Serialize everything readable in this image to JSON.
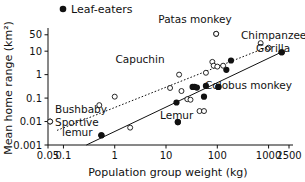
{
  "chart_data": {
    "type": "scatter",
    "title": "",
    "xlabel": "Population group weight (kg)",
    "ylabel": "Mean home range (km²)",
    "xscale": "log",
    "yscale": "log",
    "xlim": [
      0.05,
      2500
    ],
    "ylim": [
      0.001,
      80
    ],
    "grid": false,
    "xticklabels": [
      "0.05",
      "0.1",
      "1",
      "10",
      "100",
      "1000",
      "2500"
    ],
    "xtickvalues": [
      0.05,
      0.1,
      1,
      10,
      100,
      1000,
      2500
    ],
    "yticklabels": [
      "0.001",
      "0.01",
      "0.1",
      "1",
      "10",
      "50"
    ],
    "ytickvalues": [
      0.001,
      0.01,
      0.1,
      1,
      10,
      50
    ],
    "legend": {
      "position": "above-plot-left",
      "entries": [
        {
          "label": "Leaf-eaters",
          "marker": "filled-circle",
          "color": "#111111"
        }
      ]
    },
    "series": [
      {
        "name": "Leaf-eaters",
        "marker": "filled-circle",
        "color": "#111111",
        "points": [
          {
            "x": 0.55,
            "y": 0.0026,
            "label": "Sportive lemur"
          },
          {
            "x": 16,
            "y": 0.065,
            "label": ""
          },
          {
            "x": 17,
            "y": 0.0095,
            "label": "Lemur"
          },
          {
            "x": 33,
            "y": 0.3,
            "label": ""
          },
          {
            "x": 36,
            "y": 0.3,
            "label": ""
          },
          {
            "x": 40,
            "y": 0.28,
            "label": ""
          },
          {
            "x": 55,
            "y": 0.115,
            "label": ""
          },
          {
            "x": 60,
            "y": 0.33,
            "label": ""
          },
          {
            "x": 105,
            "y": 0.3,
            "label": "Colobus monkey"
          },
          {
            "x": 150,
            "y": 1.6,
            "label": ""
          },
          {
            "x": 185,
            "y": 4.0,
            "label": ""
          },
          {
            "x": 1800,
            "y": 9.0,
            "label": "Gorilla"
          }
        ]
      },
      {
        "name": "Non-leaf-eaters",
        "marker": "open-circle",
        "color": "#111111",
        "points": [
          {
            "x": 0.055,
            "y": 0.01,
            "label": "Bushbaby"
          },
          {
            "x": 0.5,
            "y": 0.05,
            "label": ""
          },
          {
            "x": 1.0,
            "y": 0.115,
            "label": ""
          },
          {
            "x": 2.0,
            "y": 0.0055,
            "label": ""
          },
          {
            "x": 12,
            "y": 0.27,
            "label": ""
          },
          {
            "x": 18,
            "y": 1.0,
            "label": "Capuchin"
          },
          {
            "x": 20,
            "y": 0.2,
            "label": ""
          },
          {
            "x": 26,
            "y": 0.09,
            "label": ""
          },
          {
            "x": 30,
            "y": 0.085,
            "label": ""
          },
          {
            "x": 45,
            "y": 0.028,
            "label": ""
          },
          {
            "x": 55,
            "y": 0.028,
            "label": ""
          },
          {
            "x": 60,
            "y": 1.2,
            "label": ""
          },
          {
            "x": 80,
            "y": 3.5,
            "label": ""
          },
          {
            "x": 85,
            "y": 2.4,
            "label": ""
          },
          {
            "x": 95,
            "y": 55,
            "label": "Patas monkey"
          },
          {
            "x": 100,
            "y": 2.2,
            "label": ""
          },
          {
            "x": 130,
            "y": 2.4,
            "label": ""
          },
          {
            "x": 700,
            "y": 22,
            "label": ""
          },
          {
            "x": 1000,
            "y": 14,
            "label": "Chimpanzee"
          }
        ]
      }
    ],
    "trendlines": [
      {
        "name": "leaf-eater-fit",
        "style": "solid",
        "x0": 0.28,
        "y0": 0.001,
        "x1": 1850,
        "y1": 9.5
      },
      {
        "name": "non-leaf-eater-fit",
        "style": "dotted",
        "x0": 0.075,
        "y0": 0.0042,
        "x1": 1050,
        "y1": 16.5
      }
    ],
    "annotations": [
      {
        "name": "patas-monkey",
        "text": "Patas monkey",
        "anchor": "middle",
        "tx": 195,
        "ty": 23
      },
      {
        "name": "chimpanzee",
        "text": "Chimpanzee",
        "anchor": "start",
        "tx": 241,
        "ty": 39
      },
      {
        "name": "gorilla",
        "text": "Gorilla",
        "anchor": "start",
        "tx": 256,
        "ty": 52
      },
      {
        "name": "capuchin",
        "text": "Capuchin",
        "anchor": "middle",
        "tx": 140,
        "ty": 63
      },
      {
        "name": "colobus-monkey",
        "text": "Colobus monkey",
        "anchor": "start",
        "tx": 205,
        "ty": 89
      },
      {
        "name": "lemur",
        "text": "Lemur",
        "anchor": "start",
        "tx": 160,
        "ty": 119
      },
      {
        "name": "bushbaby",
        "text": "Bushbaby",
        "anchor": "start",
        "tx": 55,
        "ty": 113
      },
      {
        "name": "sportive-lemur-line1",
        "text": "Sportive",
        "anchor": "start",
        "tx": 55,
        "ty": 126
      },
      {
        "name": "sportive-lemur-line2",
        "text": "lemur",
        "anchor": "start",
        "tx": 62,
        "ty": 136
      }
    ]
  },
  "legend_label": "Leaf-eaters",
  "axes": {
    "x_title": "Population group weight (kg)",
    "y_title": "Mean home range (km²)"
  },
  "colors": {
    "axis": "#111111",
    "marker_fill": "#111111",
    "marker_open": "#ffffff",
    "background": "#ffffff"
  }
}
